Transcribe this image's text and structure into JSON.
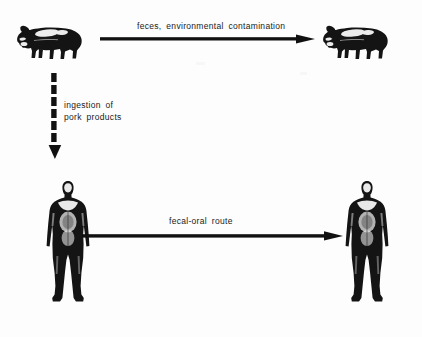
{
  "diagram": {
    "type": "transmission-cycle",
    "background_color": "#fdfdfd",
    "ink_color": "#111111",
    "nodes": [
      {
        "id": "pig-source",
        "label": "pig",
        "icon": "pig-icon",
        "x": 16,
        "y": 20
      },
      {
        "id": "pig-target",
        "label": "pig",
        "icon": "pig-icon",
        "x": 322,
        "y": 20
      },
      {
        "id": "human-source",
        "label": "human",
        "icon": "human-anatomy-icon",
        "x": 46,
        "y": 180
      },
      {
        "id": "human-target",
        "label": "human",
        "icon": "human-anatomy-icon",
        "x": 345,
        "y": 180
      }
    ],
    "edges": [
      {
        "id": "pig-to-pig",
        "label": "feces, environmental contamination",
        "style": "solid",
        "from": "pig-source",
        "to": "pig-target"
      },
      {
        "id": "pig-to-human",
        "label_line1": "ingestion  of",
        "label_line2": "pork products",
        "style": "dashed",
        "from": "pig-source",
        "to": "human-source"
      },
      {
        "id": "human-to-human",
        "label": "fecal-oral  route",
        "style": "solid",
        "from": "human-source",
        "to": "human-target"
      }
    ]
  }
}
